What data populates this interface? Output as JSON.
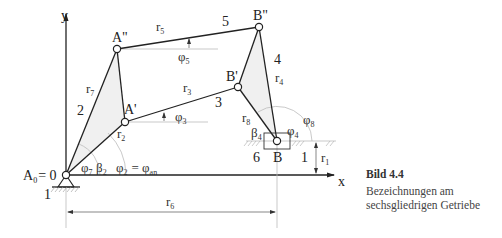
{
  "figure": {
    "caption_title": "Bild 4.4",
    "caption_lines": [
      "Bezeichnungen am",
      "sechsgliedrigen Getriebe"
    ]
  },
  "axes": {
    "x_label": "x",
    "y_label": "y"
  },
  "joints": {
    "A0": {
      "label": "A",
      "sub": "0",
      "suffix": "= 0",
      "x": 66,
      "y": 175
    },
    "A1": {
      "label": "A'",
      "x": 125,
      "y": 122
    },
    "A2": {
      "label": "A\"",
      "x": 117,
      "y": 49
    },
    "B1": {
      "label": "B'",
      "x": 238,
      "y": 87
    },
    "B2": {
      "label": "B\"",
      "x": 259,
      "y": 27
    },
    "B": {
      "label": "B",
      "x": 277,
      "y": 141
    }
  },
  "link_numbers": [
    "1",
    "2",
    "3",
    "4",
    "5",
    "6",
    "1"
  ],
  "lengths": {
    "r1": {
      "base": "r",
      "sub": "1"
    },
    "r2": {
      "base": "r",
      "sub": "2"
    },
    "r3": {
      "base": "r",
      "sub": "3"
    },
    "r4": {
      "base": "r",
      "sub": "4"
    },
    "r5": {
      "base": "r",
      "sub": "5"
    },
    "r6": {
      "base": "r",
      "sub": "6"
    },
    "r7": {
      "base": "r",
      "sub": "7"
    },
    "r8": {
      "base": "r",
      "sub": "8"
    }
  },
  "angles": {
    "phi2": {
      "base": "φ",
      "sub": "2",
      "eq": "= φ",
      "eq_sub": "an"
    },
    "phi3": {
      "base": "φ",
      "sub": "3"
    },
    "phi4": {
      "base": "φ",
      "sub": "4"
    },
    "phi5": {
      "base": "φ",
      "sub": "5"
    },
    "phi7": {
      "base": "φ",
      "sub": "7"
    },
    "phi8": {
      "base": "φ",
      "sub": "8"
    },
    "beta2": {
      "base": "β",
      "sub": "2"
    },
    "beta4": {
      "base": "β",
      "sub": "4"
    }
  }
}
